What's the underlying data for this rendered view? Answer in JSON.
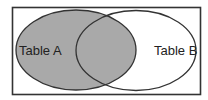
{
  "diagram": {
    "type": "venn",
    "title": "",
    "sets": [
      {
        "name": "Table A",
        "label": "Table A",
        "shaded": true
      },
      {
        "name": "Table B",
        "label": "Table B",
        "shaded": false
      }
    ],
    "intersection_shaded": true,
    "colors": {
      "fill": "#a9a9a9",
      "stroke": "#333333",
      "frame": "#333333",
      "background": "#ffffff"
    }
  }
}
